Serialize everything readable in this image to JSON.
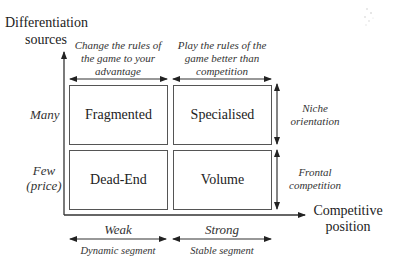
{
  "y_axis": {
    "title_line1": "Differentiation",
    "title_line2": "sources",
    "levels": [
      {
        "label": "Many"
      },
      {
        "label_line1": "Few",
        "label_line2": "(price)"
      }
    ]
  },
  "x_axis": {
    "title_line1": "Competitive",
    "title_line2": "position",
    "levels": [
      {
        "label": "Weak",
        "sub_label": "Dynamic segment"
      },
      {
        "label": "Strong",
        "sub_label": "Stable segment"
      }
    ]
  },
  "top_annotations": [
    {
      "line1": "Change the rules of",
      "line2": "the game to your",
      "line3": "advantage"
    },
    {
      "line1": "Play the rules of the",
      "line2": "game better than",
      "line3": "competition"
    }
  ],
  "right_annotations": [
    {
      "line1": "Niche",
      "line2": "orientation"
    },
    {
      "line1": "Frontal",
      "line2": "competition"
    }
  ],
  "quadrants": [
    {
      "label": "Fragmented",
      "row": "Many",
      "col": "Weak"
    },
    {
      "label": "Specialised",
      "row": "Many",
      "col": "Strong"
    },
    {
      "label": "Dead-End",
      "row": "Few (price)",
      "col": "Weak"
    },
    {
      "label": "Volume",
      "row": "Few (price)",
      "col": "Strong"
    }
  ],
  "colors": {
    "line": "#333333",
    "box_border": "#555555",
    "text": "#222222"
  }
}
